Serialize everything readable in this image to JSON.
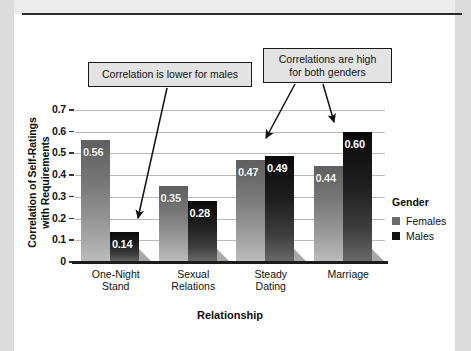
{
  "figure": {
    "panel_bg": "#ffffff",
    "page_bg": "#ececed",
    "rule_color": "#2a2a2a"
  },
  "chart_data": {
    "type": "bar",
    "title": "",
    "xlabel": "Relationship",
    "ylabel": "Correlation of Self-Ratings with Requirements",
    "categories": [
      "One-Night Stand",
      "Sexual Relations",
      "Steady Dating",
      "Marriage"
    ],
    "category_lines": [
      [
        "One-Night",
        "Stand"
      ],
      [
        "Sexual",
        "Relations"
      ],
      [
        "Steady",
        "Dating"
      ],
      [
        "Marriage",
        ""
      ]
    ],
    "series": [
      {
        "name": "Females",
        "color": "#6d6d6d",
        "values": [
          0.56,
          0.35,
          0.47,
          0.44
        ],
        "labels": [
          "0.56",
          "0.35",
          "0.47",
          "0.44"
        ]
      },
      {
        "name": "Males",
        "color": "#121212",
        "values": [
          0.14,
          0.28,
          0.49,
          0.6
        ],
        "labels": [
          "0.14",
          "0.28",
          "0.49",
          "0.60"
        ]
      }
    ],
    "ylim": [
      0,
      0.7
    ],
    "yticks": [
      0,
      0.1,
      0.2,
      0.3,
      0.4,
      0.5,
      0.6,
      0.7
    ],
    "ytick_labels": [
      "0",
      "0.1",
      "0.2",
      "0.3",
      "0.4",
      "0.5",
      "0.6",
      "0.7"
    ],
    "grid": true,
    "legend_position": "right",
    "legend_title": "Gender",
    "annotations": [
      {
        "text": "Correlation is lower for males",
        "lines": [
          "Correlation is lower for males"
        ],
        "points_to": "Males bar, One-Night Stand"
      },
      {
        "text": "Correlations are high for both genders",
        "lines": [
          "Correlations are high",
          "for both genders"
        ],
        "points_to": "Steady Dating and Marriage bars"
      }
    ]
  },
  "legend": {
    "title": "Gender",
    "items": [
      {
        "label": "Females",
        "swatch": "#6d6d6d"
      },
      {
        "label": "Males",
        "swatch": "#121212"
      }
    ]
  },
  "axes": {
    "y_title_line1": "Correlation of Self-Ratings",
    "y_title_line2": "with Requirements",
    "x_title": "Relationship"
  }
}
